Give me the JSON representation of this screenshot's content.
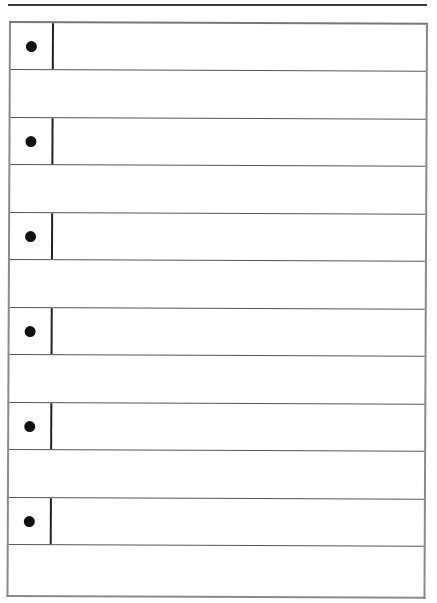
{
  "page": {
    "type": "bulleted-ruled-worksheet",
    "rows": [
      {
        "kind": "bullet",
        "text": ""
      },
      {
        "kind": "blank",
        "text": ""
      },
      {
        "kind": "bullet",
        "text": ""
      },
      {
        "kind": "blank",
        "text": ""
      },
      {
        "kind": "bullet",
        "text": ""
      },
      {
        "kind": "blank",
        "text": ""
      },
      {
        "kind": "bullet",
        "text": ""
      },
      {
        "kind": "blank",
        "text": ""
      },
      {
        "kind": "bullet",
        "text": ""
      },
      {
        "kind": "blank",
        "text": ""
      },
      {
        "kind": "bullet",
        "text": ""
      },
      {
        "kind": "blank",
        "text": ""
      }
    ],
    "icons": {
      "bullet": "filled-circle"
    },
    "colors": {
      "line": "#555555",
      "border": "#8a8a8a",
      "bullet": "#111111"
    }
  }
}
